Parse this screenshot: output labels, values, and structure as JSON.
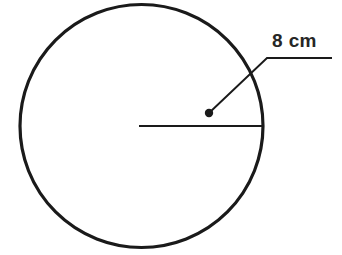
{
  "figure": {
    "type": "geometry-diagram",
    "background_color": "#ffffff",
    "stroke_color": "#1a1a1a",
    "text_color": "#262626",
    "canvas": {
      "width": 342,
      "height": 255
    }
  },
  "circle": {
    "name": "circle-outline",
    "center_x": 141.5,
    "center_y": 126,
    "radius_px": 121.5,
    "stroke_width": 3.2,
    "fill": "none"
  },
  "radius_line": {
    "name": "radius-segment",
    "x1": 139,
    "y1": 126,
    "x2": 263,
    "y2": 126,
    "stroke_width": 2.2
  },
  "leader": {
    "name": "leader-line",
    "dot_x": 209,
    "dot_y": 113,
    "dot_radius": 4.2,
    "bend_x": 267,
    "bend_y": 58,
    "end_x": 332,
    "end_y": 58,
    "stroke_width": 1.9
  },
  "label": {
    "text": "8 cm",
    "value": 8,
    "unit": "cm",
    "x": 272,
    "y": 31,
    "font_size_px": 19,
    "bold": true
  }
}
